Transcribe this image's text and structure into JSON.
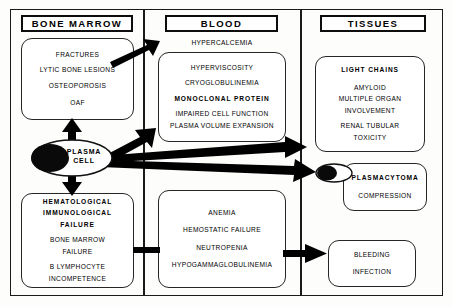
{
  "diagram": {
    "columns": [
      {
        "id": "bone-marrow",
        "header": "BONE  MARROW"
      },
      {
        "id": "blood",
        "header": "BLOOD"
      },
      {
        "id": "tissues",
        "header": "TISSUES"
      }
    ],
    "central_node": {
      "name": "plasma-cell",
      "label_line1": "PLASMA",
      "label_line2": "CELL"
    },
    "boxes": {
      "bone_marrow": {
        "name": "bone-marrow-effects",
        "lines": [
          {
            "text": "FRACTURES",
            "bold": false
          },
          {
            "text": "LYTIC BONE LESIONS",
            "bold": false
          },
          {
            "text": "OSTEOPOROSIS",
            "bold": false
          },
          {
            "text": "OAF",
            "bold": false
          }
        ]
      },
      "blood_top": {
        "name": "blood-protein-effects",
        "floating_label": "HYPERCALCEMIA",
        "lines": [
          {
            "text": "HYPERVISCOSITY",
            "bold": false
          },
          {
            "text": "CRYOGLOBULINEMIA",
            "bold": false
          },
          {
            "text": "MONOCLONAL  PROTEIN",
            "bold": true
          },
          {
            "text": "IMPAIRED CELL FUNCTION",
            "bold": false
          },
          {
            "text": "PLASMA VOLUME EXPANSION",
            "bold": false
          }
        ]
      },
      "light_chains": {
        "name": "light-chains-effects",
        "lines": [
          {
            "text": "LIGHT  CHAINS",
            "bold": true
          },
          {
            "text": "AMYLOID",
            "bold": false
          },
          {
            "text": "MULTIPLE ORGAN",
            "bold": false
          },
          {
            "text": "INVOLVEMENT",
            "bold": false
          },
          {
            "text": "RENAL TUBULAR",
            "bold": false
          },
          {
            "text": "TOXICITY",
            "bold": false
          }
        ]
      },
      "hematological": {
        "name": "hematological-immunological-failure",
        "lines": [
          {
            "text": "HEMATOLOGICAL",
            "bold": true
          },
          {
            "text": "IMMUNOLOGICAL",
            "bold": true
          },
          {
            "text": "FAILURE",
            "bold": true
          },
          {
            "text": "BONE MARROW",
            "bold": false
          },
          {
            "text": "FAILURE",
            "bold": false
          },
          {
            "text": "B LYMPHOCYTE",
            "bold": false
          },
          {
            "text": "INCOMPETENCE",
            "bold": false
          }
        ]
      },
      "blood_bottom": {
        "name": "blood-cytopenia-effects",
        "lines": [
          {
            "text": "ANEMIA",
            "bold": false
          },
          {
            "text": "HEMOSTATIC FAILURE",
            "bold": false
          },
          {
            "text": "NEUTROPENIA",
            "bold": false
          },
          {
            "text": "HYPOGAMMAGLOBULINEMIA",
            "bold": false
          }
        ]
      },
      "plasmacytoma": {
        "name": "plasmacytoma-effects",
        "lines": [
          {
            "text": "PLASMACYTOMA",
            "bold": true
          },
          {
            "text": "COMPRESSION",
            "bold": false
          }
        ]
      },
      "bleeding": {
        "name": "bleeding-infection-effects",
        "lines": [
          {
            "text": "BLEEDING",
            "bold": false
          },
          {
            "text": "INFECTION",
            "bold": false
          }
        ]
      }
    },
    "connectors": [
      {
        "name": "arrow-plasmacell-to-bone-marrow",
        "from": "plasma-cell",
        "to": "bone-marrow-effects",
        "direction": "up",
        "arrowhead": true
      },
      {
        "name": "arrow-plasmacell-to-hematological",
        "from": "plasma-cell",
        "to": "hematological-failure",
        "direction": "down",
        "arrowhead": true
      },
      {
        "name": "arrow-plasmacell-to-blood-protein",
        "from": "plasma-cell",
        "to": "blood-protein-effects",
        "direction": "up-right",
        "arrowhead": true
      },
      {
        "name": "arrow-plasmacell-to-light-chains",
        "from": "plasma-cell",
        "to": "light-chains-effects",
        "direction": "right",
        "arrowhead": true
      },
      {
        "name": "arrow-plasmacell-to-plasmacytoma",
        "from": "plasma-cell",
        "to": "plasmacytoma-effects",
        "direction": "down-right",
        "arrowhead": true
      },
      {
        "name": "arrow-bone-marrow-to-hypercalcemia",
        "from": "bone-marrow-effects",
        "to": "hypercalcemia",
        "direction": "up-right",
        "arrowhead": true
      },
      {
        "name": "connector-hematological-to-blood",
        "from": "hematological-failure",
        "to": "blood-cytopenia",
        "direction": "right",
        "arrowhead": false
      },
      {
        "name": "arrow-blood-to-bleeding",
        "from": "blood-cytopenia",
        "to": "bleeding-infection",
        "direction": "right",
        "arrowhead": true
      }
    ],
    "colors": {
      "ink": "#000000",
      "frame": "#1a1a1a",
      "box_border": "#262626",
      "paper": "#fdfdfb",
      "nucleus": "#0a0a0a"
    }
  }
}
